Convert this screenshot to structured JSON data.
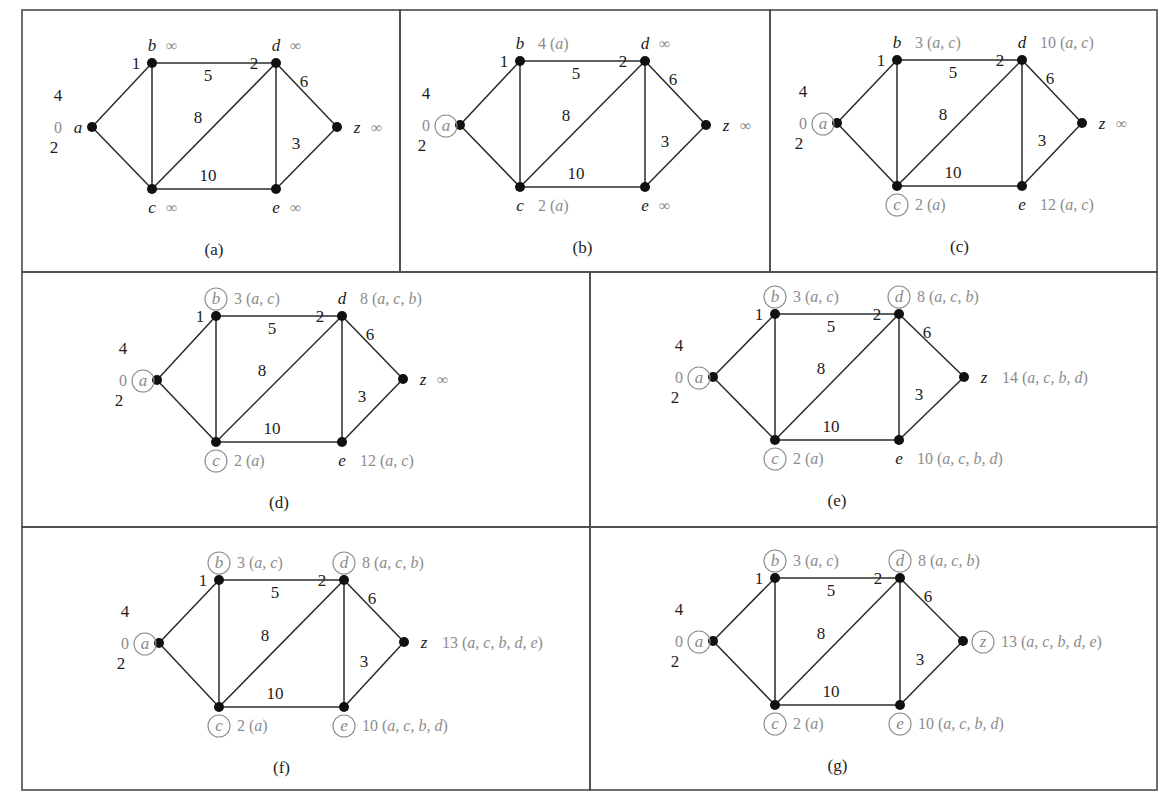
{
  "figure": {
    "edges": [
      {
        "from": "a",
        "to": "b",
        "weight": "4"
      },
      {
        "from": "a",
        "to": "c",
        "weight": "2"
      },
      {
        "from": "b",
        "to": "c",
        "weight": "1"
      },
      {
        "from": "b",
        "to": "d",
        "weight": "5"
      },
      {
        "from": "c",
        "to": "d",
        "weight": "8"
      },
      {
        "from": "c",
        "to": "e",
        "weight": "10"
      },
      {
        "from": "d",
        "to": "e",
        "weight": "2"
      },
      {
        "from": "d",
        "to": "z",
        "weight": "6"
      },
      {
        "from": "e",
        "to": "z",
        "weight": "3"
      }
    ],
    "panels": [
      {
        "caption": "(a)",
        "box": [
          22,
          10,
          378,
          262
        ],
        "nodes": {
          "a": {
            "pos": [
              92,
              127
            ],
            "label": "0",
            "circled": false
          },
          "b": {
            "pos": [
              152,
              63
            ],
            "label": "∞",
            "circled": false
          },
          "c": {
            "pos": [
              152,
              189
            ],
            "label": "∞",
            "circled": false
          },
          "d": {
            "pos": [
              276,
              63
            ],
            "label": "∞",
            "circled": false
          },
          "e": {
            "pos": [
              276,
              189
            ],
            "label": "∞",
            "circled": false
          },
          "z": {
            "pos": [
              337,
              127
            ],
            "label": "∞",
            "circled": false
          }
        }
      },
      {
        "caption": "(b)",
        "box": [
          400,
          10,
          370,
          262
        ],
        "nodes": {
          "a": {
            "pos": [
              460,
              125
            ],
            "label": "0",
            "circled": true
          },
          "b": {
            "pos": [
              520,
              61
            ],
            "label": "4 (a)",
            "circled": false
          },
          "c": {
            "pos": [
              520,
              187
            ],
            "label": "2 (a)",
            "circled": false
          },
          "d": {
            "pos": [
              645,
              61
            ],
            "label": "∞",
            "circled": false
          },
          "e": {
            "pos": [
              645,
              187
            ],
            "label": "∞",
            "circled": false
          },
          "z": {
            "pos": [
              706,
              125
            ],
            "label": "∞",
            "circled": false
          }
        }
      },
      {
        "caption": "(c)",
        "box": [
          770,
          10,
          387,
          262
        ],
        "nodes": {
          "a": {
            "pos": [
              837,
              123
            ],
            "label": "0",
            "circled": true
          },
          "b": {
            "pos": [
              897,
              60
            ],
            "label": "3 (a, c)",
            "circled": false
          },
          "c": {
            "pos": [
              897,
              186
            ],
            "label": "2 (a)",
            "circled": true
          },
          "d": {
            "pos": [
              1022,
              60
            ],
            "label": "10 (a, c)",
            "circled": false
          },
          "e": {
            "pos": [
              1022,
              186
            ],
            "label": "12 (a, c)",
            "circled": false
          },
          "z": {
            "pos": [
              1082,
              123
            ],
            "label": "∞",
            "circled": false
          }
        }
      },
      {
        "caption": "(d)",
        "box": [
          22,
          272,
          568,
          255
        ],
        "nodes": {
          "a": {
            "pos": [
              157,
              380
            ],
            "label": "0",
            "circled": true
          },
          "b": {
            "pos": [
              216,
              316
            ],
            "label": "3 (a, c)",
            "circled": true
          },
          "c": {
            "pos": [
              216,
              442
            ],
            "label": "2 (a)",
            "circled": true
          },
          "d": {
            "pos": [
              342,
              316
            ],
            "label": "8 (a, c, b)",
            "circled": false
          },
          "e": {
            "pos": [
              342,
              442
            ],
            "label": "12 (a, c)",
            "circled": false
          },
          "z": {
            "pos": [
              403,
              379
            ],
            "label": "∞",
            "circled": false
          }
        }
      },
      {
        "caption": "(e)",
        "box": [
          590,
          272,
          567,
          255
        ],
        "nodes": {
          "a": {
            "pos": [
              713,
              377
            ],
            "label": "0",
            "circled": true
          },
          "b": {
            "pos": [
              775,
              314
            ],
            "label": "3 (a, c)",
            "circled": true
          },
          "c": {
            "pos": [
              775,
              440
            ],
            "label": "2 (a)",
            "circled": true
          },
          "d": {
            "pos": [
              899,
              314
            ],
            "label": "8 (a, c, b)",
            "circled": true
          },
          "e": {
            "pos": [
              899,
              440
            ],
            "label": "10 (a, c, b, d)",
            "circled": false
          },
          "z": {
            "pos": [
              964,
              377
            ],
            "label": "14 (a, c, b, d)",
            "circled": false
          }
        }
      },
      {
        "caption": "(f)",
        "box": [
          22,
          527,
          568,
          263
        ],
        "nodes": {
          "a": {
            "pos": [
              159,
              643
            ],
            "label": "0",
            "circled": true
          },
          "b": {
            "pos": [
              219,
              580
            ],
            "label": "3 (a, c)",
            "circled": true
          },
          "c": {
            "pos": [
              219,
              707
            ],
            "label": "2 (a)",
            "circled": true
          },
          "d": {
            "pos": [
              344,
              580
            ],
            "label": "8 (a, c, b)",
            "circled": true
          },
          "e": {
            "pos": [
              344,
              707
            ],
            "label": "10 (a, c, b, d)",
            "circled": true
          },
          "z": {
            "pos": [
              404,
              642
            ],
            "label": "13 (a, c, b, d, e)",
            "circled": false
          }
        }
      },
      {
        "caption": "(g)",
        "box": [
          590,
          527,
          567,
          263
        ],
        "nodes": {
          "a": {
            "pos": [
              713,
              641
            ],
            "label": "0",
            "circled": true
          },
          "b": {
            "pos": [
              775,
              578
            ],
            "label": "3 (a, c)",
            "circled": true
          },
          "c": {
            "pos": [
              775,
              705
            ],
            "label": "2 (a)",
            "circled": true
          },
          "d": {
            "pos": [
              900,
              578
            ],
            "label": "8 (a, c, b)",
            "circled": true
          },
          "e": {
            "pos": [
              900,
              705
            ],
            "label": "10 (a, c, b, d)",
            "circled": true
          },
          "z": {
            "pos": [
              963,
              641
            ],
            "label": "13 (a, c, b, d, e)",
            "circled": true
          }
        }
      }
    ]
  }
}
